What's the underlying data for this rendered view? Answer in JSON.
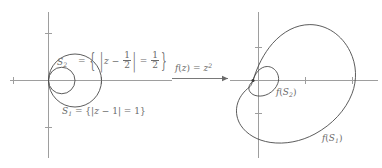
{
  "figure": {
    "background_color": "#ffffff",
    "axis_color": "#9a9a9a",
    "curve_color": "#4a4a4a",
    "label_color": "#6a6a6a"
  },
  "left_panel": {
    "name": "domain-plane",
    "circles": [
      {
        "id": "S1",
        "label_text": "S₁ = {|z − 1| = 1}",
        "center_re": 1,
        "center_im": 0,
        "radius": 1,
        "equation": "|z - 1| = 1"
      },
      {
        "id": "S2",
        "label_text": "S₂ = {|z − 1/2| = 1/2}",
        "center_re": 0.5,
        "center_im": 0,
        "radius": 0.5,
        "equation": "|z - 1/2| = 1/2"
      }
    ],
    "s2_label": {
      "name": "S",
      "sub": "2",
      "equals": "=",
      "brace_open": "{",
      "bar": "|",
      "var": "z",
      "minus": "−",
      "frac1_num": "1",
      "frac1_den": "2",
      "eq2": "=",
      "frac2_num": "1",
      "frac2_den": "2",
      "brace_close": "}"
    },
    "s1_label": {
      "name": "S",
      "sub": "1",
      "equals": "=",
      "brace_open": "{",
      "bar_open": "|",
      "var": "z",
      "minus": "−",
      "one": "1",
      "bar_close": "|",
      "eq2": "=",
      "value": "1",
      "brace_close": "}"
    }
  },
  "map_arrow": {
    "name": "transformation-arrow",
    "label_f": "f",
    "label_paren_open": "(",
    "label_var": "z",
    "label_paren_close": ")",
    "label_equals": "=",
    "label_z": "z",
    "label_exponent": "2",
    "full_text": "f(z) = z²",
    "direction": "right"
  },
  "right_panel": {
    "name": "image-plane",
    "curves": [
      {
        "id": "f(S1)",
        "label_f": "f",
        "label_paren_open": "(",
        "label_s": "S",
        "label_sub": "1",
        "label_paren_close": ")",
        "full_text": "f(S₁)",
        "shape": "cardioid",
        "polar_equation": "r = 2(1 + cosθ)",
        "max_extent": 4
      },
      {
        "id": "f(S2)",
        "label_f": "f",
        "label_paren_open": "(",
        "label_s": "S",
        "label_sub": "2",
        "label_paren_close": ")",
        "full_text": "f(S₂)",
        "shape": "cardioid",
        "polar_equation": "r = 0.5(1 + cosθ)",
        "max_extent": 1
      }
    ]
  }
}
